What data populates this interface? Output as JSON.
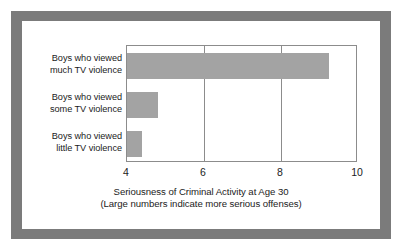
{
  "chart_data": {
    "type": "bar",
    "orientation": "horizontal",
    "title": "",
    "xlabel": "Seriousness of Criminal Activity at Age 30",
    "xlabel_note": "(Large numbers indicate more serious offenses)",
    "ylabel": "",
    "categories": [
      "Boys who viewed much TV violence",
      "Boys who viewed some TV violence",
      "Boys who viewed little TV violence"
    ],
    "category_lines": [
      [
        "Boys who viewed",
        "much TV violence"
      ],
      [
        "Boys who viewed",
        "some TV violence"
      ],
      [
        "Boys who viewed",
        "little TV violence"
      ]
    ],
    "values": [
      9.25,
      4.8,
      4.4
    ],
    "xlim": [
      4,
      10
    ],
    "xticks": [
      4,
      6,
      8,
      10
    ],
    "xtick_labels": [
      "4",
      "6",
      "8",
      "10"
    ],
    "grid": "vertical-at-ticks",
    "legend": "none",
    "bar_color": "#a3a3a3",
    "axis_color": "#8c8c8c",
    "frame_color": "#7b7b7b",
    "text_color": "#1b1b1b"
  }
}
